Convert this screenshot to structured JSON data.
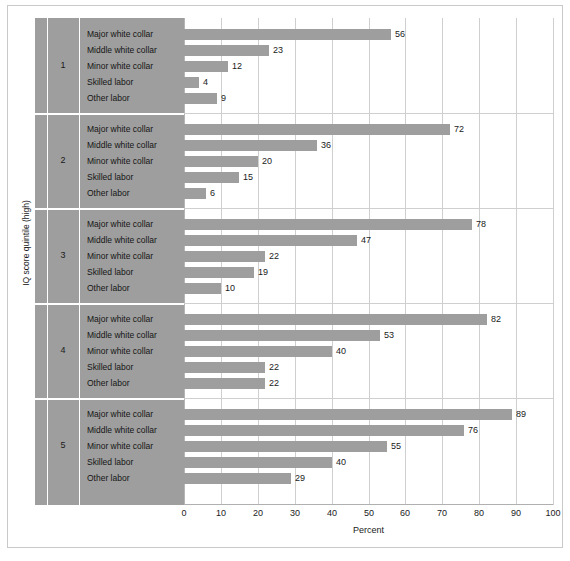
{
  "chart_data": {
    "type": "bar",
    "orientation": "horizontal",
    "title": "",
    "xlabel": "Percent",
    "ylabel": "IQ score quintile (high)",
    "xlim": [
      0,
      100
    ],
    "xticks": [
      0,
      10,
      20,
      30,
      40,
      50,
      60,
      70,
      80,
      90,
      100
    ],
    "xticklabels": [
      "0",
      "10",
      "20",
      "30",
      "40",
      "50",
      "60",
      "70",
      "80",
      "90",
      "100"
    ],
    "grid": "vertical",
    "legend": "none",
    "categories": [
      "Major white collar",
      "Middle white collar",
      "Minor white collar",
      "Skilled labor",
      "Other labor"
    ],
    "groups": [
      {
        "name": "1",
        "values": [
          56,
          23,
          12,
          4,
          9
        ],
        "labels": [
          "56",
          "23",
          "12",
          "4",
          "9"
        ]
      },
      {
        "name": "2",
        "values": [
          72,
          36,
          20,
          15,
          6
        ],
        "labels": [
          "72",
          "36",
          "20",
          "15",
          "6"
        ]
      },
      {
        "name": "3",
        "values": [
          78,
          47,
          22,
          19,
          10
        ],
        "labels": [
          "78",
          "47",
          "22",
          "19",
          "10"
        ]
      },
      {
        "name": "4",
        "values": [
          82,
          53,
          40,
          22,
          22
        ],
        "labels": [
          "82",
          "53",
          "40",
          "22",
          "22"
        ]
      },
      {
        "name": "5",
        "values": [
          89,
          76,
          55,
          40,
          29
        ],
        "labels": [
          "89",
          "76",
          "55",
          "40",
          "29"
        ]
      }
    ],
    "colors": {
      "bar": "#9e9e9e",
      "panel": "#9e9e9e",
      "gridline": "#cfcfcf",
      "axis": "#b0b0b0",
      "text": "#1a1a1a",
      "background": "#ffffff",
      "frame": "#c9c9c9"
    }
  }
}
